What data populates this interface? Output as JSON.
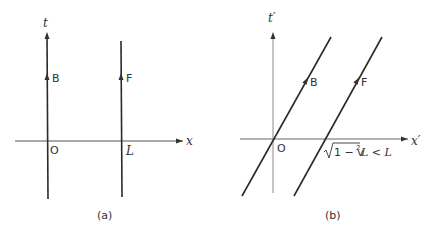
{
  "diagram_a": {
    "caption": "(a)",
    "axes": {
      "time_label": "t",
      "space_label": "x",
      "origin_label": "O",
      "position_label": "L"
    },
    "worldlines": [
      {
        "name": "B",
        "label": "B",
        "x": 0
      },
      {
        "name": "F",
        "label": "F",
        "x": "L"
      }
    ]
  },
  "diagram_b": {
    "caption": "(b)",
    "axes": {
      "time_label": "t′",
      "space_label": "x′",
      "origin_label": "O"
    },
    "worldlines": [
      {
        "name": "B",
        "label": "B"
      },
      {
        "name": "F",
        "label": "F"
      }
    ],
    "annotation": {
      "radical": "1 − v",
      "exponent": "2",
      "suffix": "L < L"
    }
  },
  "colors": {
    "line": "#2a2a2a",
    "axis": "#555555",
    "axis_light": "#8a8a8a"
  }
}
